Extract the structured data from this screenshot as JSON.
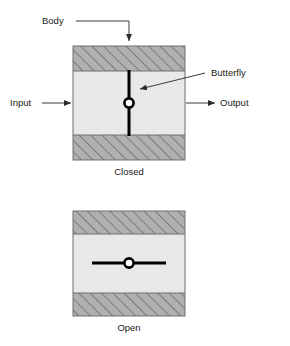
{
  "figure": {
    "colors": {
      "body_hatch_fill": "#b0b0b0",
      "body_hatch_line": "#555555",
      "interior_fill": "#e8e8e8",
      "outline": "#6e6e6e",
      "disc": "#000000",
      "leader": "#3a3a3a",
      "text": "#1a1a1a",
      "background": "#ffffff"
    }
  },
  "labels": {
    "body": "Body",
    "butterfly": "Butterfly",
    "input": "Input",
    "output": "Output"
  },
  "views": [
    {
      "id": "closed",
      "caption": "Closed",
      "disc_orientation": "vertical",
      "description": "Butterfly disc rotated perpendicular to flow, blocking the passage"
    },
    {
      "id": "open",
      "caption": "Open",
      "disc_orientation": "horizontal",
      "description": "Butterfly disc rotated parallel to flow, allowing passage"
    }
  ],
  "caption_bottom": ""
}
